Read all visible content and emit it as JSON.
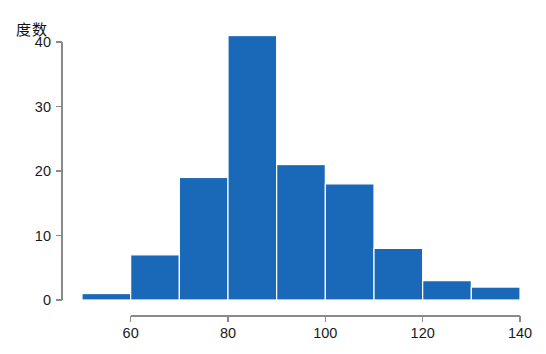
{
  "chart_data": {
    "type": "bar",
    "title": "",
    "subtitle": "",
    "xlabel": "",
    "ylabel": "度数",
    "categories": [
      "50-60",
      "60-70",
      "70-80",
      "80-90",
      "90-100",
      "100-110",
      "110-120",
      "120-130",
      "130-140"
    ],
    "bin_edges": [
      50,
      60,
      70,
      80,
      90,
      100,
      110,
      120,
      130,
      140
    ],
    "values": [
      1,
      7,
      19,
      41,
      21,
      18,
      8,
      3,
      2
    ],
    "x": [
      55,
      65,
      75,
      85,
      95,
      105,
      115,
      125,
      135
    ],
    "xlim": [
      50,
      140
    ],
    "ylim": [
      0,
      41
    ],
    "xticks": [
      60,
      80,
      100,
      120,
      140
    ],
    "yticks": [
      0,
      10,
      20,
      30,
      40
    ],
    "xtick_labels": [
      "60",
      "80",
      "100",
      "120",
      "140"
    ],
    "ytick_labels": [
      "0",
      "10",
      "20",
      "30",
      "40"
    ],
    "grid": false,
    "legend": null,
    "legend_position": "none",
    "bar_color": "#1a69b8",
    "bar_edge_color": "#ffffff",
    "axis_color": "#8a8a8a",
    "background_color": "#ffffff"
  }
}
